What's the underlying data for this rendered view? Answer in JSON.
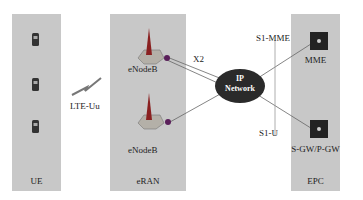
{
  "diagram": {
    "type": "LTE network architecture",
    "domains": [
      {
        "id": "ue",
        "label": "UE"
      },
      {
        "id": "eran",
        "label": "eRAN"
      },
      {
        "id": "epc",
        "label": "EPC"
      }
    ],
    "nodes": {
      "ue_count": 3,
      "enodeb_1": "eNodeB",
      "enodeb_2": "eNodeB",
      "ip_network_line1": "IP",
      "ip_network_line2": "Network",
      "mme": "MME",
      "gw": "S-GW/P-GW"
    },
    "interfaces": {
      "air": "LTE-Uu",
      "x2": "X2",
      "s1_mme": "S1-MME",
      "s1_u": "S1-U"
    },
    "colors": {
      "panel": "#c8c8c8",
      "cloud": "#2a2a2a",
      "link": "#666666",
      "antenna": "#8a2020"
    }
  }
}
